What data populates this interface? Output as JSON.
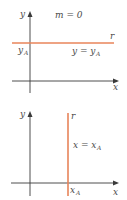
{
  "colors": {
    "line": "#e8845a",
    "axis": "#3a3a3a",
    "text": "#4a4a4a"
  },
  "panels": [
    {
      "name": "horizontal-line",
      "slope_label": "m = 0",
      "axis_y_label": "y",
      "axis_x_label": "x",
      "line_label": "r",
      "intercept_label": "y",
      "intercept_sub": "A",
      "equation_main": "y = y",
      "equation_sub": "A"
    },
    {
      "name": "vertical-line",
      "axis_y_label": "y",
      "axis_x_label": "x",
      "line_label": "r",
      "intercept_label": "x",
      "intercept_sub": "A",
      "equation_main": "x = x",
      "equation_sub": "A"
    }
  ]
}
